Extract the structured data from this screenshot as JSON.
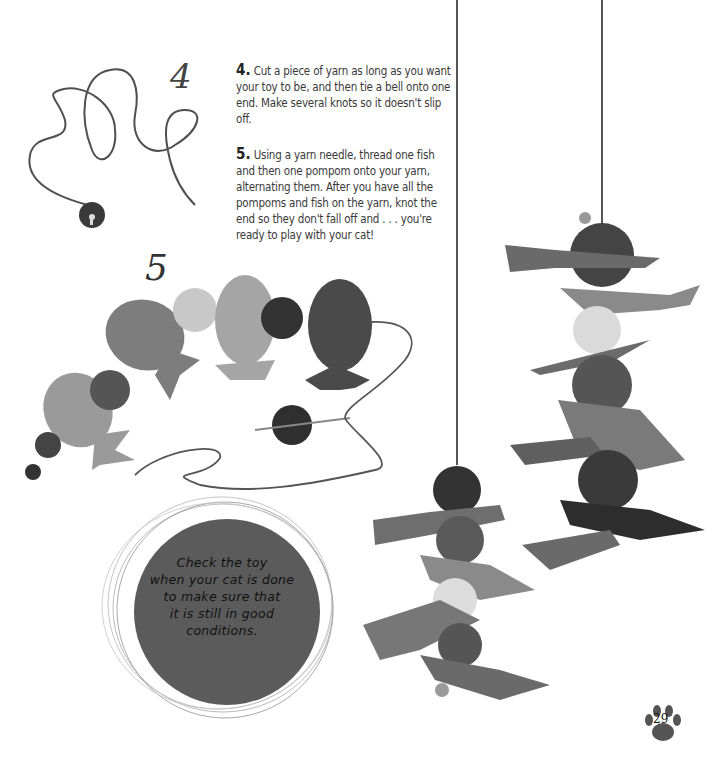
{
  "page": {
    "page_number": "29"
  },
  "illustrations": {
    "step4_label": "4",
    "step5_label": "5"
  },
  "steps": [
    {
      "number": "4.",
      "text": "Cut a piece of yarn as long as you want your toy to be, and then tie a bell onto one end. Make several knots so it doesn't slip off."
    },
    {
      "number": "5.",
      "text": "Using a yarn needle, thread one fish and then one pompom onto your yarn, alternating them. After you have all the pompoms and fish on the yarn, knot the end so they don't fall off and . . . you're ready to play with your cat!"
    }
  ],
  "callout": {
    "lines": [
      "Check the toy",
      "when your cat is done",
      "to make sure that",
      "it is still in good",
      "conditions."
    ]
  },
  "colors": {
    "yarn": "#555555",
    "fish_light": "#9a9a9a",
    "fish_mid": "#7a7a7a",
    "fish_dark": "#4a4a4a",
    "pompom_dark": "#3a3a3a",
    "pompom_light": "#d8d8d8",
    "callout_bg": "#5a5a5a"
  }
}
